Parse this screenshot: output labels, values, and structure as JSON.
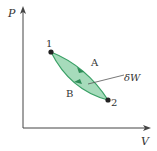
{
  "diagram": {
    "type": "PV cycle",
    "axes": {
      "y_label": "P",
      "x_label": "V"
    },
    "points": [
      {
        "label": "1",
        "x": 51,
        "y": 52
      },
      {
        "label": "2",
        "x": 108,
        "y": 100
      }
    ],
    "paths": [
      {
        "label": "A",
        "from": "1",
        "to": "2",
        "position": "upper"
      },
      {
        "label": "B",
        "from": "2",
        "to": "1",
        "position": "lower"
      }
    ],
    "area_label": "δW",
    "colors": {
      "fill": "#9fd8b4",
      "stroke": "#3aa066",
      "axis": "#444444"
    }
  }
}
